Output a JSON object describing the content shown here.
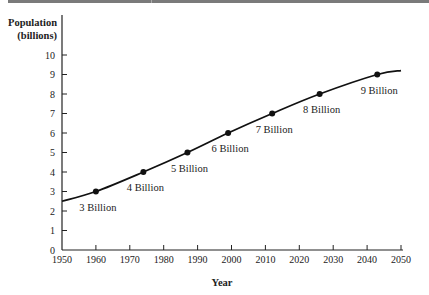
{
  "chart_data": {
    "type": "line",
    "title": "",
    "xlabel": "Year",
    "ylabel": "Population (billions)",
    "ylabel_lines": [
      "Population",
      "(billions)"
    ],
    "xlim": [
      1950,
      2050
    ],
    "ylim": [
      0,
      10
    ],
    "x_ticks": [
      1950,
      1960,
      1970,
      1980,
      1990,
      2000,
      2010,
      2020,
      2030,
      2040,
      2050
    ],
    "y_ticks": [
      0,
      1,
      2,
      3,
      4,
      5,
      6,
      7,
      8,
      9,
      10
    ],
    "grid": false,
    "legend": null,
    "series": [
      {
        "name": "World population",
        "x": [
          1950,
          1960,
          1974,
          1987,
          1999,
          2012,
          2026,
          2043,
          2050
        ],
        "values": [
          2.5,
          3,
          4,
          5,
          6,
          7,
          8,
          9,
          9.2
        ]
      }
    ],
    "milestones": [
      {
        "year": 1960,
        "value": 3,
        "label": "3 Billion"
      },
      {
        "year": 1974,
        "value": 4,
        "label": "4 Billion"
      },
      {
        "year": 1987,
        "value": 5,
        "label": "5 Billion"
      },
      {
        "year": 1999,
        "value": 6,
        "label": "6 Billion"
      },
      {
        "year": 2012,
        "value": 7,
        "label": "7 Billion"
      },
      {
        "year": 2026,
        "value": 8,
        "label": "8 Billion"
      },
      {
        "year": 2043,
        "value": 9,
        "label": "9 Billion"
      }
    ]
  }
}
